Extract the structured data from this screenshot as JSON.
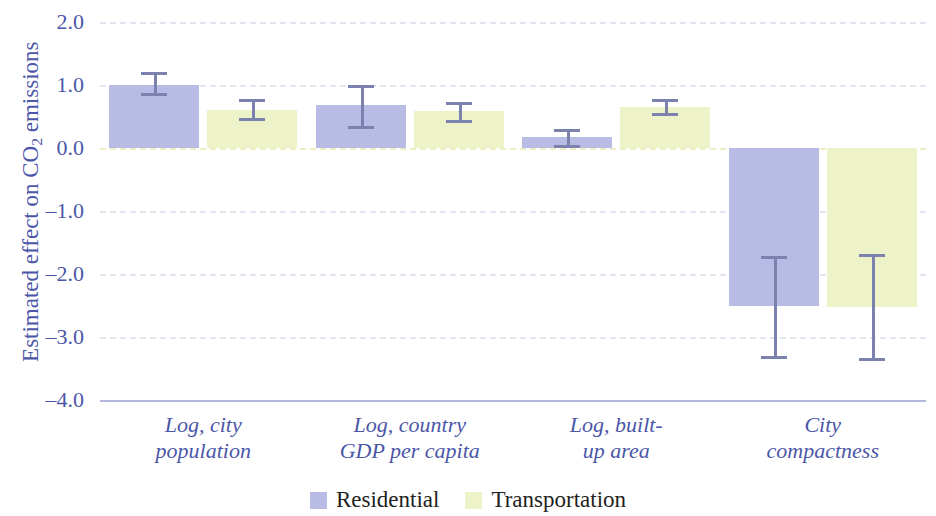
{
  "chart_data": {
    "type": "bar",
    "title": "",
    "subtitle": "",
    "xlabel": "",
    "ylabel": "Estimated effect on CO2 emissions",
    "ylabel_parts": {
      "pre": "Estimated effect on CO",
      "sub": "2",
      "post": " emissions"
    },
    "ylim": [
      -4.0,
      2.0
    ],
    "yticks": [
      "2.0",
      "1.0",
      "0.0",
      "–1.0",
      "–2.0",
      "–3.0",
      "–4.0"
    ],
    "ytick_values": [
      2.0,
      1.0,
      0.0,
      -1.0,
      -2.0,
      -3.0,
      -4.0
    ],
    "grid": true,
    "grid_style": "dashed",
    "zero_line": true,
    "legend_position": "bottom-center",
    "categories": [
      "Log, city population",
      "Log, country GDP per capita",
      "Log, built-up area",
      "City compactness"
    ],
    "category_lines": [
      [
        "Log, city",
        "population"
      ],
      [
        "Log, country",
        "GDP per capita"
      ],
      [
        "Log, built-",
        "up area"
      ],
      [
        "City",
        "compactness"
      ]
    ],
    "series": [
      {
        "name": "Residential",
        "color": "#b8bce4",
        "values": [
          1.0,
          0.68,
          0.18,
          -2.5
        ],
        "err_low": [
          0.88,
          0.35,
          0.05,
          -3.3
        ],
        "err_high": [
          1.2,
          1.0,
          0.3,
          -1.72
        ]
      },
      {
        "name": "Transportation",
        "color": "#eef2c8",
        "values": [
          0.6,
          0.58,
          0.65,
          -2.52
        ],
        "err_low": [
          0.47,
          0.44,
          0.55,
          -3.33
        ],
        "err_high": [
          0.78,
          0.73,
          0.78,
          -1.68
        ]
      }
    ],
    "colors": {
      "residential": "#b8bce4",
      "transportation": "#eef2c8",
      "error_bar": "#7b82ad",
      "axis_text": "#4b56a8",
      "legend_text": "#231f20",
      "gridline": "#e2e4f2",
      "zero_gridline": "#edeec2",
      "axis_line": "#b3b7dd"
    }
  },
  "legend": {
    "items": [
      {
        "label": "Residential",
        "key": "residential"
      },
      {
        "label": "Transportation",
        "key": "transportation"
      }
    ]
  }
}
